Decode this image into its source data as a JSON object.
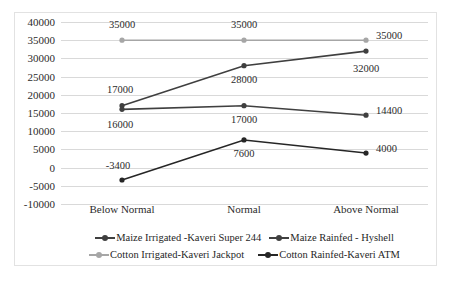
{
  "chart_data": {
    "type": "line",
    "title": "",
    "xlabel": "",
    "ylabel": "",
    "categories": [
      "Below Normal",
      "Normal",
      "Above Normal"
    ],
    "ylim": [
      -10000,
      40000
    ],
    "ytick_step": 5000,
    "yticks": [
      "40000",
      "35000",
      "30000",
      "25000",
      "20000",
      "15000",
      "10000",
      "5000",
      "0",
      "-5000",
      "-10000"
    ],
    "grid": true,
    "legend_position": "bottom",
    "series": [
      {
        "name": "Maize Irrigated -Kaveri Super 244",
        "color": "#3f3f3f",
        "values": [
          17000,
          28000,
          32000
        ],
        "labels": [
          "17000",
          "28000",
          "32000"
        ]
      },
      {
        "name": "Maize Rainfed - Hyshell",
        "color": "#404040",
        "values": [
          16000,
          17000,
          14400
        ],
        "labels": [
          "16000",
          "17000",
          "14400"
        ]
      },
      {
        "name": "Cotton Irrigated-Kaveri Jackpot",
        "color": "#a6a6a6",
        "values": [
          35000,
          35000,
          35000
        ],
        "labels": [
          "35000",
          "35000",
          "35000"
        ]
      },
      {
        "name": "Cotton Rainfed-Kaveri ATM",
        "color": "#262626",
        "values": [
          -3400,
          7600,
          4000
        ],
        "labels": [
          "-3400",
          "7600",
          "4000"
        ]
      }
    ]
  },
  "legend": {
    "row1": [
      "Maize Irrigated -Kaveri Super 244",
      "Maize Rainfed - Hyshell"
    ],
    "row2": [
      "Cotton Irrigated-Kaveri Jackpot",
      "Cotton Rainfed-Kaveri ATM"
    ]
  }
}
